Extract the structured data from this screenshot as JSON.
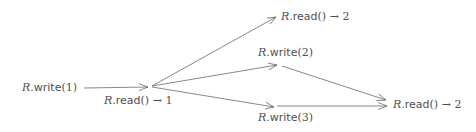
{
  "diagram": {
    "type": "history / event graph",
    "nodes": [
      {
        "id": "w1",
        "label": {
          "obj": "R",
          "op": "write",
          "args": "(1)",
          "result": ""
        },
        "x": 22,
        "y": 82
      },
      {
        "id": "r1",
        "label": {
          "obj": "R",
          "op": "read",
          "args": "()",
          "result": " → 1"
        },
        "x": 104,
        "y": 95
      },
      {
        "id": "r2a",
        "label": {
          "obj": "R",
          "op": "read",
          "args": "()",
          "result": " → 2"
        },
        "x": 281,
        "y": 11
      },
      {
        "id": "w2",
        "label": {
          "obj": "R",
          "op": "write",
          "args": "(2)",
          "result": ""
        },
        "x": 258,
        "y": 47
      },
      {
        "id": "w3",
        "label": {
          "obj": "R",
          "op": "write",
          "args": "(3)",
          "result": ""
        },
        "x": 258,
        "y": 112
      },
      {
        "id": "r2b",
        "label": {
          "obj": "R",
          "op": "read",
          "args": "()",
          "result": " → 2"
        },
        "x": 393,
        "y": 99
      }
    ],
    "edges": [
      {
        "from": "w1",
        "to": "r1",
        "x1": 84,
        "y1": 88,
        "x2": 148,
        "y2": 87
      },
      {
        "from": "r1",
        "to": "r2a",
        "x1": 152,
        "y1": 86,
        "x2": 276,
        "y2": 17
      },
      {
        "from": "r1",
        "to": "w2",
        "x1": 152,
        "y1": 86,
        "x2": 277,
        "y2": 65
      },
      {
        "from": "r1",
        "to": "w3",
        "x1": 152,
        "y1": 87,
        "x2": 274,
        "y2": 107
      },
      {
        "from": "w2",
        "to": "r2b",
        "x1": 282,
        "y1": 66,
        "x2": 386,
        "y2": 100
      },
      {
        "from": "w3",
        "to": "r2b",
        "x1": 277,
        "y1": 106,
        "x2": 387,
        "y2": 106
      }
    ],
    "colors": {
      "text": "#505050",
      "edge": "#6a6a6a",
      "background": "#ffffff"
    }
  }
}
